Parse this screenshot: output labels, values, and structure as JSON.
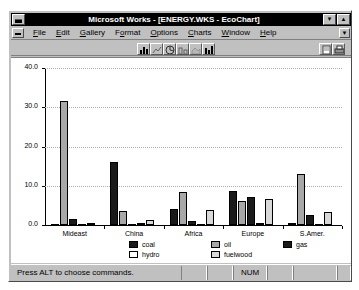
{
  "window": {
    "title": "Microsoft Works - [ENERGY.WKS - EcoChart]",
    "sysmenu_icon": "system-menu-icon",
    "minimize_icon": "▼",
    "maximize_icon": "▲"
  },
  "menubar": {
    "doc_sysmenu_icon": "document-system-menu-icon",
    "items": [
      {
        "label": "File",
        "accel": "F"
      },
      {
        "label": "Edit",
        "accel": "E"
      },
      {
        "label": "Gallery",
        "accel": "G"
      },
      {
        "label": "Format",
        "accel": "o"
      },
      {
        "label": "Options",
        "accel": "O"
      },
      {
        "label": "Charts",
        "accel": "C"
      },
      {
        "label": "Window",
        "accel": "W"
      },
      {
        "label": "Help",
        "accel": "H"
      }
    ],
    "restore_icon": "▼"
  },
  "toolbar": {
    "left_buttons": [
      {
        "name": "bar-chart-button"
      },
      {
        "name": "line-chart-button"
      },
      {
        "name": "pie-chart-button"
      },
      {
        "name": "stacked-bar-chart-button"
      },
      {
        "name": "area-chart-button"
      },
      {
        "name": "combo-chart-button"
      }
    ],
    "right_buttons": [
      {
        "name": "page-preview-button"
      },
      {
        "name": "print-button"
      }
    ]
  },
  "statusbar": {
    "message": "Press ALT to choose commands.",
    "num_indicator": "NUM",
    "blank_cell": ""
  },
  "chart_data": {
    "type": "bar",
    "title": "",
    "xlabel": "",
    "ylabel": "",
    "ylim": [
      0.0,
      40.0
    ],
    "yticks": [
      "0.0",
      "10.0",
      "20.0",
      "30.0",
      "40.0"
    ],
    "grid": true,
    "legend_position": "bottom",
    "categories": [
      "Mideast",
      "China",
      "Africa",
      "Europe",
      "S.Amer."
    ],
    "series": [
      {
        "name": "coal",
        "color": "#1a1a1a",
        "values": [
          0.0,
          16.0,
          4.0,
          8.6,
          0.5
        ]
      },
      {
        "name": "oil",
        "color": "#a8a8a8",
        "values": [
          31.6,
          3.6,
          8.4,
          6.1,
          12.9
        ]
      },
      {
        "name": "gas",
        "color": "#1a1a1a",
        "values": [
          1.6,
          0.1,
          1.0,
          7.2,
          2.5
        ]
      },
      {
        "name": "hydro",
        "color": "#ffffff",
        "values": [
          0.1,
          0.5,
          0.3,
          0.4,
          0.3
        ]
      },
      {
        "name": "fuelwood",
        "color": "#d8d8d8",
        "values": [
          0.4,
          1.2,
          3.9,
          6.6,
          3.2
        ]
      }
    ],
    "legend_entries": [
      {
        "label": "coal",
        "color": "#1a1a1a"
      },
      {
        "label": "oil",
        "color": "#a8a8a8"
      },
      {
        "label": "gas",
        "color": "#1a1a1a"
      },
      {
        "label": "hydro",
        "color": "#ffffff"
      },
      {
        "label": "fuelwood",
        "color": "#d8d8d8"
      }
    ]
  }
}
